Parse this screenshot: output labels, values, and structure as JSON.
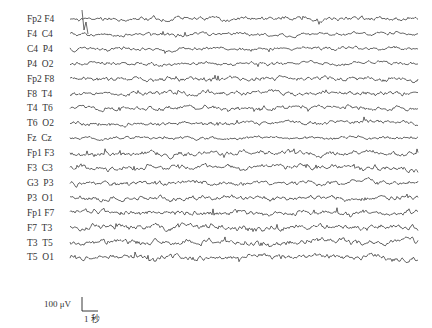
{
  "chart_data": {
    "type": "line",
    "title": "",
    "channels": [
      "Fp2 F4",
      "F4  C4",
      "C4  P4",
      "P4  O2",
      "Fp2 F8",
      "F8  T4",
      "T4  T6",
      "T6  O2",
      "Fz  Cz",
      "Fp1 F3",
      "F3  C3",
      "G3  P3",
      "P3  O1",
      "Fp1 F7",
      "F7  T3",
      "T3  T5",
      "T5  O1"
    ],
    "channel_amplitude_hint": [
      0.9,
      0.8,
      0.8,
      0.8,
      1.0,
      1.0,
      1.0,
      0.9,
      0.7,
      1.1,
      1.1,
      1.1,
      1.1,
      1.2,
      1.2,
      1.3,
      1.3
    ],
    "x_start": 70,
    "x_end": 418,
    "row_top": 19,
    "row_spacing": 14.9,
    "scale_bar": {
      "amplitude_label": "100 μV",
      "time_label": "1 秒",
      "amplitude_uv": 100,
      "time_s": 1
    },
    "grid": false,
    "legend": "none",
    "trace_color": "#2a2a2a"
  }
}
